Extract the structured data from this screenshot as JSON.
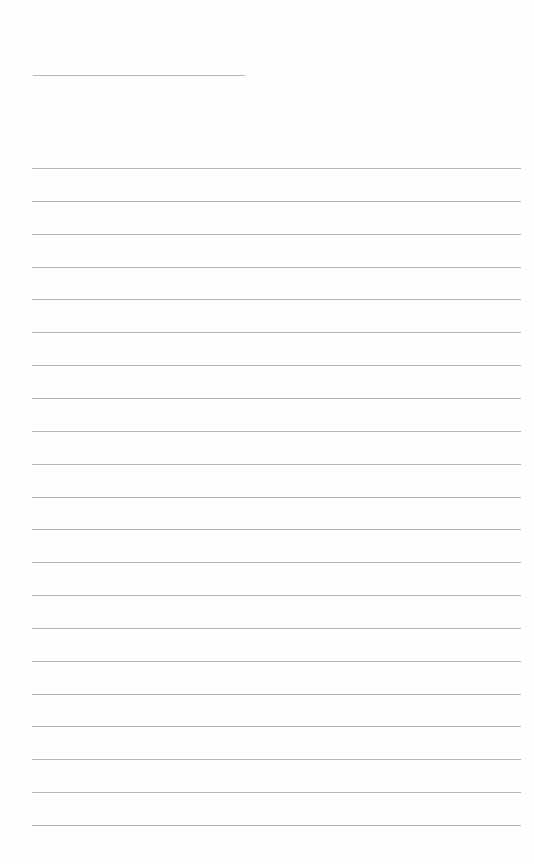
{
  "page": {
    "type": "lined-paper",
    "background": "#ffffff",
    "line_color": "#b4b4b4",
    "title_line": {
      "present": true
    },
    "ruled_lines": {
      "count": 21,
      "first_y": 168,
      "spacing": 32.85
    },
    "text": ""
  }
}
